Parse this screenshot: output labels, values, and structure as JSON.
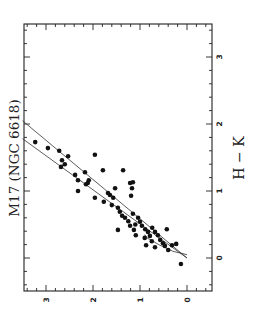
{
  "chart_data": {
    "type": "scatter",
    "title": "M17 (NGC 6618)",
    "xlabel": "H − K",
    "ylabel": "J − H",
    "orientation_note": "figure rendered rotated 90° counter-clockwise",
    "xlim": [
      -0.5,
      3.5
    ],
    "ylim": [
      -0.5,
      3.5
    ],
    "x_ticks": [
      "0",
      "1",
      "2",
      "3"
    ],
    "y_ticks": [
      "0",
      "1",
      "2",
      "3"
    ],
    "grid": false,
    "legend": null,
    "series": [
      {
        "name": "stars",
        "marker": "filled-circle",
        "points": [
          [
            1.73,
            3.23
          ],
          [
            1.64,
            2.96
          ],
          [
            1.6,
            2.72
          ],
          [
            1.52,
            2.53
          ],
          [
            1.46,
            2.66
          ],
          [
            1.4,
            2.6
          ],
          [
            1.36,
            2.68
          ],
          [
            1.54,
            1.96
          ],
          [
            1.28,
            2.17
          ],
          [
            1.24,
            2.38
          ],
          [
            1.16,
            2.32
          ],
          [
            1.31,
            1.79
          ],
          [
            1.31,
            1.36
          ],
          [
            1.12,
            2.11
          ],
          [
            1.1,
            2.15
          ],
          [
            1.16,
            2.09
          ],
          [
            1.0,
            2.32
          ],
          [
            0.9,
            1.96
          ],
          [
            0.97,
            1.68
          ],
          [
            1.04,
            1.53
          ],
          [
            1.12,
            1.21
          ],
          [
            1.04,
            1.17
          ],
          [
            1.13,
            1.15
          ],
          [
            0.93,
            1.19
          ],
          [
            0.94,
            1.64
          ],
          [
            0.9,
            1.57
          ],
          [
            0.79,
            1.6
          ],
          [
            0.84,
            1.77
          ],
          [
            0.75,
            1.47
          ],
          [
            0.69,
            1.43
          ],
          [
            0.63,
            1.38
          ],
          [
            0.6,
            1.32
          ],
          [
            0.42,
            1.47
          ],
          [
            0.48,
            1.21
          ],
          [
            0.66,
            1.15
          ],
          [
            0.6,
            1.04
          ],
          [
            0.54,
            1.0
          ],
          [
            0.48,
            0.96
          ],
          [
            0.43,
            0.89
          ],
          [
            0.42,
            1.13
          ],
          [
            0.34,
            1.09
          ],
          [
            0.39,
            0.83
          ],
          [
            0.33,
            0.79
          ],
          [
            0.45,
            0.74
          ],
          [
            0.39,
            0.68
          ],
          [
            0.34,
            0.62
          ],
          [
            0.27,
            0.57
          ],
          [
            0.22,
            0.51
          ],
          [
            0.18,
            0.47
          ],
          [
            0.12,
            0.4
          ],
          [
            0.19,
            0.32
          ],
          [
            0.43,
            0.43
          ],
          [
            0.21,
            0.23
          ],
          [
            -0.09,
            0.13
          ],
          [
            0.19,
            0.87
          ],
          [
            0.16,
            0.68
          ],
          [
            0.55,
            1.25
          ],
          [
            0.5,
            1.1
          ],
          [
            0.3,
            0.9
          ],
          [
            0.25,
            0.75
          ]
        ]
      }
    ],
    "lines": [
      {
        "name": "reddening-band-upper",
        "from": [
          0.0,
          0.0
        ],
        "to": [
          2.05,
          3.5
        ]
      },
      {
        "name": "reddening-band-lower",
        "from": [
          0.0,
          0.0
        ],
        "to": [
          1.78,
          3.5
        ]
      },
      {
        "name": "intrinsic-locus",
        "points": [
          [
            0.05,
            0.0
          ],
          [
            0.1,
            0.3
          ],
          [
            0.2,
            0.6
          ],
          [
            0.3,
            0.85
          ],
          [
            0.35,
            0.9
          ]
        ]
      }
    ]
  }
}
